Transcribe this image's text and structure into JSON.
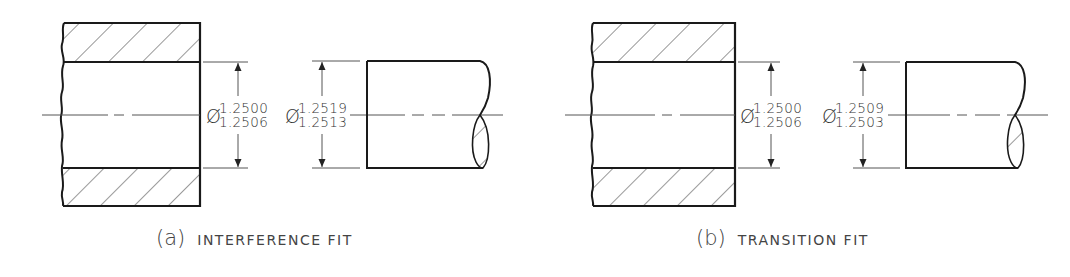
{
  "figure": {
    "panels": [
      {
        "id": "a",
        "caption_tag": "(a)",
        "caption_text": "INTERFERENCE FIT",
        "hole_diameter": {
          "symbol": "Ø",
          "upper": "1.2500",
          "lower": "1.2506"
        },
        "shaft_diameter": {
          "symbol": "Ø",
          "upper": "1.2519",
          "lower": "1.2513"
        }
      },
      {
        "id": "b",
        "caption_tag": "(b)",
        "caption_text": "TRANSITION FIT",
        "hole_diameter": {
          "symbol": "Ø",
          "upper": "1.2500",
          "lower": "1.2506"
        },
        "shaft_diameter": {
          "symbol": "Ø",
          "upper": "1.2509",
          "lower": "1.2503"
        }
      }
    ],
    "colors": {
      "line": "#1a1a1a",
      "thin_line": "#555555",
      "text": "#333333"
    }
  }
}
